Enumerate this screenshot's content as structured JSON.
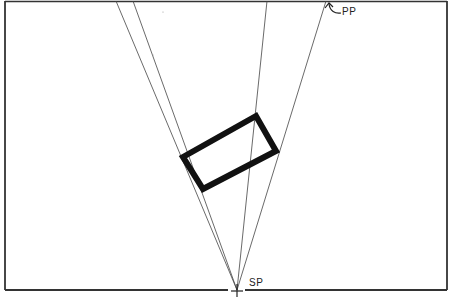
{
  "diagram": {
    "type": "perspective-plan-view",
    "labels": {
      "picture_plane": "PP",
      "station_point": "SP"
    },
    "colors": {
      "ink": "#1a1a1a",
      "thin_line": "#444444",
      "background": "#ffffff"
    },
    "frame": {
      "left": 5,
      "top": 1,
      "right": 447,
      "bottom": 290
    },
    "picture_plane_y": 1,
    "station_point": {
      "x": 237,
      "y": 290
    },
    "object_rectangle": {
      "corners": [
        [
          183,
          157
        ],
        [
          256,
          116
        ],
        [
          276,
          151
        ],
        [
          203,
          189
        ]
      ]
    },
    "sight_lines": [
      {
        "from": [
          237,
          290
        ],
        "to": [
          116,
          1
        ]
      },
      {
        "from": [
          237,
          290
        ],
        "to": [
          133,
          1
        ]
      },
      {
        "from": [
          237,
          290
        ],
        "to": [
          267,
          1
        ]
      },
      {
        "from": [
          237,
          290
        ],
        "to": [
          326,
          1
        ]
      }
    ]
  }
}
